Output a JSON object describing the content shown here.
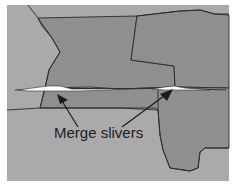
{
  "figure": {
    "annotation": {
      "label": "Merge slivers",
      "arrow_count": 2
    },
    "colors": {
      "background": "#ffffff",
      "light_region": "#aaaaaa",
      "dark_region": "#8f8f8f",
      "boundary": "#2a2a2a",
      "sliver": "#ffffff",
      "arrow": "#1a1a1a"
    },
    "regions": [
      {
        "name": "left-dark-polygon",
        "shade": "dark"
      },
      {
        "name": "right-dark-polygon",
        "shade": "dark"
      },
      {
        "name": "center-strip-polygon",
        "shade": "dark"
      },
      {
        "name": "lower-right-dark-polygon",
        "shade": "dark"
      },
      {
        "name": "light-background-region",
        "shade": "light"
      }
    ],
    "slivers": [
      {
        "name": "left-sliver"
      },
      {
        "name": "right-sliver"
      }
    ]
  }
}
